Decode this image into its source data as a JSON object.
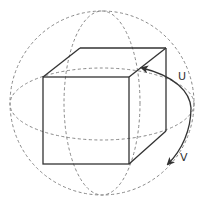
{
  "diagram": {
    "labels": {
      "u": "U",
      "v": "V"
    },
    "colors": {
      "line": "#333333",
      "dashed": "#888888",
      "background": "#ffffff"
    },
    "elements": [
      "sphere-outline",
      "equator-ellipse",
      "meridian-ellipse",
      "cube",
      "rotation-arrow-u",
      "rotation-arrow-v"
    ]
  }
}
